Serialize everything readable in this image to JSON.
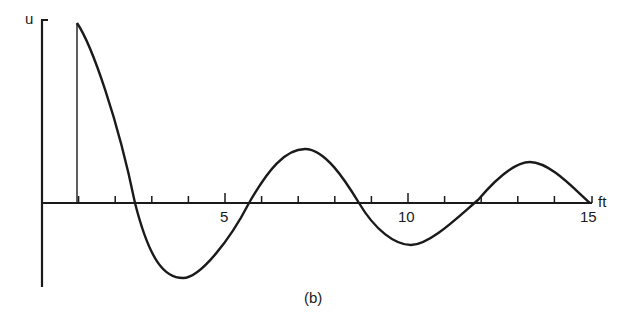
{
  "figure": {
    "caption": "(b)",
    "ylabel": "u",
    "xlabel": "ft",
    "xticks": [
      {
        "value": 5,
        "label": "5"
      },
      {
        "value": 10,
        "label": "10"
      },
      {
        "value": 15,
        "label": "15"
      }
    ]
  },
  "chart_data": {
    "type": "line",
    "title": "",
    "caption": "(b)",
    "xlabel": "ft",
    "ylabel": "u",
    "xlim": [
      0,
      15
    ],
    "ylim": [
      -1,
      2.3
    ],
    "grid": false,
    "legend": null,
    "tick_labels_x": [
      "5",
      "10",
      "15"
    ],
    "minor_ticks_x": [
      1,
      2,
      3,
      4,
      5,
      6,
      7,
      8,
      9,
      10,
      11,
      12,
      13,
      14
    ],
    "annotations": [
      "vertical line at ft=1 from axis to start of curve"
    ],
    "series": [
      {
        "name": "u(ft)",
        "x": [
          1.0,
          1.5,
          2.0,
          2.5,
          3.0,
          3.5,
          4.0,
          4.5,
          5.0,
          5.5,
          6.0,
          6.5,
          7.0,
          7.5,
          8.0,
          8.5,
          9.0,
          9.5,
          10.0,
          10.5,
          11.0,
          11.5,
          12.0,
          12.5,
          13.0,
          13.5,
          14.0,
          14.5,
          15.0
        ],
        "y": [
          2.25,
          1.75,
          1.05,
          0.3,
          -0.45,
          -0.95,
          -1.0,
          -0.75,
          -0.35,
          0.0,
          0.3,
          0.5,
          0.57,
          0.45,
          0.15,
          -0.1,
          -0.3,
          -0.4,
          -0.42,
          -0.3,
          -0.1,
          0.05,
          0.22,
          0.35,
          0.42,
          0.38,
          0.22,
          0.08,
          0.0
        ]
      }
    ]
  }
}
